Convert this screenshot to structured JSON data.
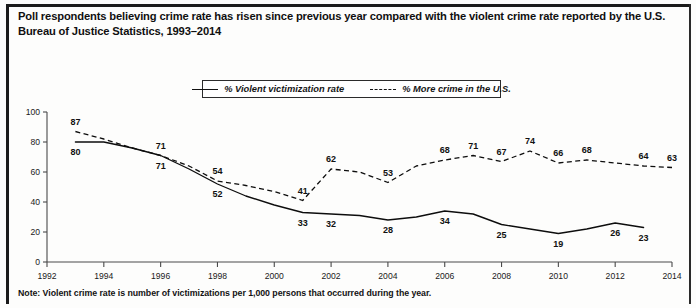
{
  "figure": {
    "title": "Poll respondents believing crime rate has risen since previous year compared with the violent crime rate reported by the U.S. Bureau of Justice Statistics, 1993–2014",
    "note": "Note: Violent crime rate is number of victimizations per 1,000 persons that occurred during the year."
  },
  "legend": {
    "items": [
      {
        "label": "% Violent victimization rate",
        "style": "solid"
      },
      {
        "label": "% More crime in the U.S.",
        "style": "dashed"
      }
    ]
  },
  "chart_data": {
    "type": "line",
    "title": "Poll respondents believing crime rate has risen since previous year compared with the violent crime rate reported by the U.S. Bureau of Justice Statistics, 1993–2014",
    "xlabel": "",
    "ylabel": "",
    "xlim": [
      1992,
      2014
    ],
    "ylim": [
      0,
      100
    ],
    "yticks": [
      0,
      20,
      40,
      60,
      80,
      100
    ],
    "xticks": [
      1992,
      1994,
      1996,
      1998,
      2000,
      2002,
      2004,
      2006,
      2008,
      2010,
      2012,
      2014
    ],
    "grid": false,
    "legend_position": "top-center",
    "x": [
      1993,
      1994,
      1995,
      1996,
      1997,
      1998,
      1999,
      2000,
      2001,
      2002,
      2003,
      2004,
      2005,
      2006,
      2007,
      2008,
      2009,
      2010,
      2011,
      2012,
      2013,
      2014
    ],
    "series": [
      {
        "name": "% Violent victimization rate",
        "style": "solid",
        "x": [
          1993,
          1994,
          1995,
          1996,
          1997,
          1998,
          1999,
          2000,
          2001,
          2002,
          2003,
          2004,
          2005,
          2006,
          2007,
          2008,
          2009,
          2010,
          2011,
          2012,
          2013
        ],
        "values": [
          80,
          80,
          76,
          71,
          62,
          52,
          44,
          38,
          33,
          32,
          31,
          28,
          30,
          34,
          32,
          25,
          22,
          19,
          22,
          26,
          23
        ],
        "labeled_points": [
          {
            "year": 1993,
            "value": 80,
            "label": "80"
          },
          {
            "year": 1996,
            "value": 71,
            "label": "71"
          },
          {
            "year": 1998,
            "value": 52,
            "label": "52"
          },
          {
            "year": 2001,
            "value": 33,
            "label": "33"
          },
          {
            "year": 2002,
            "value": 32,
            "label": "32"
          },
          {
            "year": 2004,
            "value": 28,
            "label": "28"
          },
          {
            "year": 2006,
            "value": 34,
            "label": "34"
          },
          {
            "year": 2008,
            "value": 25,
            "label": "25"
          },
          {
            "year": 2010,
            "value": 19,
            "label": "19"
          },
          {
            "year": 2012,
            "value": 26,
            "label": "26"
          },
          {
            "year": 2013,
            "value": 23,
            "label": "23"
          }
        ]
      },
      {
        "name": "% More crime in the U.S.",
        "style": "dashed",
        "x": [
          1993,
          1994,
          1995,
          1996,
          1997,
          1998,
          1999,
          2000,
          2001,
          2002,
          2003,
          2004,
          2005,
          2006,
          2007,
          2008,
          2009,
          2010,
          2011,
          2012,
          2013,
          2014
        ],
        "values": [
          87,
          82,
          76,
          71,
          64,
          54,
          51,
          47,
          41,
          62,
          60,
          53,
          64,
          68,
          71,
          67,
          74,
          66,
          68,
          66,
          64,
          63
        ],
        "labeled_points": [
          {
            "year": 1993,
            "value": 87,
            "label": "87"
          },
          {
            "year": 1996,
            "value": 71,
            "label": "71"
          },
          {
            "year": 1998,
            "value": 54,
            "label": "54"
          },
          {
            "year": 2001,
            "value": 41,
            "label": "41"
          },
          {
            "year": 2002,
            "value": 62,
            "label": "62"
          },
          {
            "year": 2004,
            "value": 53,
            "label": "53"
          },
          {
            "year": 2006,
            "value": 68,
            "label": "68"
          },
          {
            "year": 2007,
            "value": 71,
            "label": "71"
          },
          {
            "year": 2008,
            "value": 67,
            "label": "67"
          },
          {
            "year": 2009,
            "value": 74,
            "label": "74"
          },
          {
            "year": 2010,
            "value": 66,
            "label": "66"
          },
          {
            "year": 2011,
            "value": 68,
            "label": "68"
          },
          {
            "year": 2013,
            "value": 64,
            "label": "64"
          },
          {
            "year": 2014,
            "value": 63,
            "label": "63"
          }
        ]
      }
    ]
  },
  "colors": {
    "ink": "#111111",
    "axis": "#4a4a4a",
    "background": "#ffffff"
  }
}
